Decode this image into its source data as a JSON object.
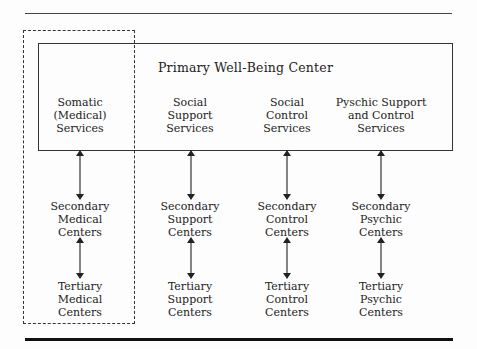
{
  "diagram": {
    "title": "Primary Well-Being Center",
    "columns": [
      {
        "id": "medical",
        "service": "Somatic\n(Medical)\nServices",
        "secondary": "Secondary\nMedical\nCenters",
        "tertiary": "Tertiary\nMedical\nCenters",
        "x": 80
      },
      {
        "id": "support",
        "service": "Social\nSupport\nServices",
        "secondary": "Secondary\nSupport\nCenters",
        "tertiary": "Tertiary\nSupport\nCenters",
        "x": 190
      },
      {
        "id": "control",
        "service": "Social\nControl\nServices",
        "secondary": "Secondary\nControl\nCenters",
        "tertiary": "Tertiary\nControl\nCenters",
        "x": 287
      },
      {
        "id": "psychic",
        "service": "Pyschic Support\nand Control\nServices",
        "secondary": "Secondary\nPsychic\nCenters",
        "tertiary": "Tertiary\nPsychic\nCenters",
        "x": 381
      }
    ],
    "highlight": "dashed box around medical column",
    "colors": {
      "line": "#333333",
      "text": "#222222",
      "background": "#fdfdfd"
    }
  }
}
